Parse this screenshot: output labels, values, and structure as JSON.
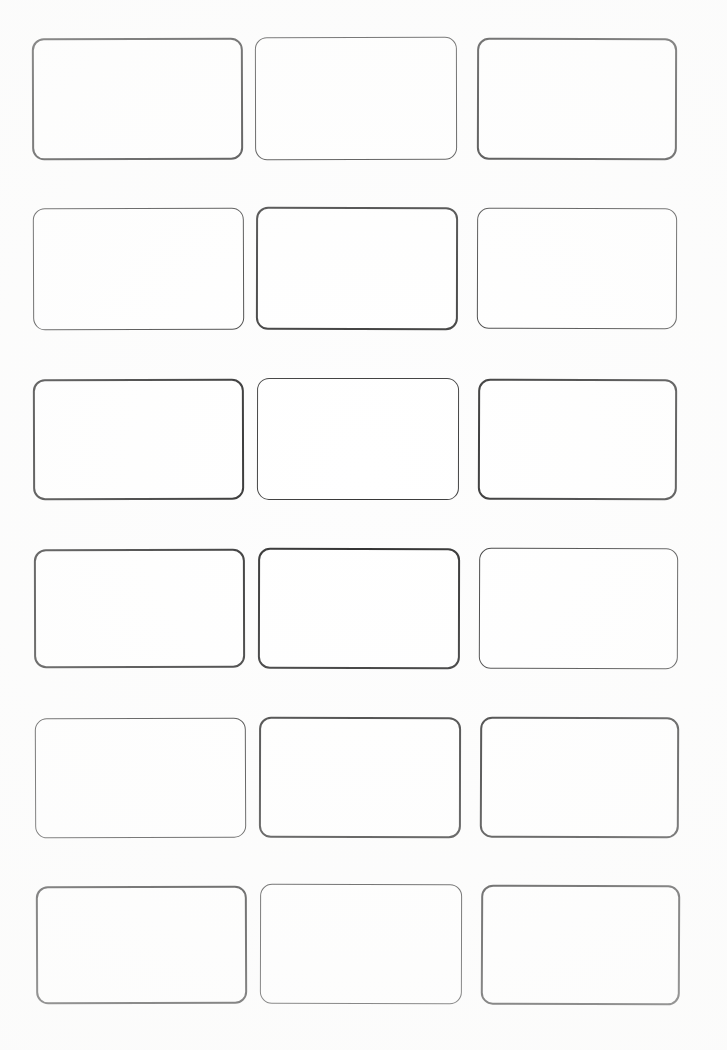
{
  "sheet": {
    "title": "Blank Card Grid Sheet",
    "width": 727,
    "height": 1050,
    "background_color": "#fdfdfd",
    "columns": 3,
    "rows": 6,
    "card_count": 18,
    "stroke_color": "#2b2b2b",
    "stroke_width_px": 2,
    "corner_radius_px": 12,
    "card_fill_color": "#ffffff",
    "content": ""
  },
  "cards": [
    {
      "id": "card-r1c1",
      "row": 1,
      "column": 1,
      "label": "",
      "x": 32,
      "y": 38,
      "width": 211,
      "height": 122,
      "radius": 12,
      "ink": "ink-a",
      "rotate": -0.18
    },
    {
      "id": "card-r1c2",
      "row": 1,
      "column": 2,
      "label": "",
      "x": 255,
      "y": 37,
      "width": 202,
      "height": 123,
      "radius": 12,
      "ink": "ink-b",
      "rotate": -0.12
    },
    {
      "id": "card-r1c3",
      "row": 1,
      "column": 3,
      "label": "",
      "x": 477,
      "y": 38,
      "width": 200,
      "height": 122,
      "radius": 12,
      "ink": "ink-c",
      "rotate": 0.14
    },
    {
      "id": "card-r2c1",
      "row": 2,
      "column": 1,
      "label": "",
      "x": 33,
      "y": 208,
      "width": 211,
      "height": 122,
      "radius": 12,
      "ink": "ink-b",
      "rotate": -0.2
    },
    {
      "id": "card-r2c2",
      "row": 2,
      "column": 2,
      "label": "",
      "x": 256,
      "y": 207,
      "width": 202,
      "height": 123,
      "radius": 12,
      "ink": "ink-a",
      "rotate": 0.1
    },
    {
      "id": "card-r2c3",
      "row": 2,
      "column": 3,
      "label": "",
      "x": 477,
      "y": 208,
      "width": 200,
      "height": 121,
      "radius": 12,
      "ink": "ink-b",
      "rotate": 0.16
    },
    {
      "id": "card-r3c1",
      "row": 3,
      "column": 1,
      "label": "",
      "x": 33,
      "y": 379,
      "width": 211,
      "height": 121,
      "radius": 12,
      "ink": "ink-c",
      "rotate": -0.16
    },
    {
      "id": "card-r3c2",
      "row": 3,
      "column": 2,
      "label": "",
      "x": 257,
      "y": 378,
      "width": 202,
      "height": 122,
      "radius": 12,
      "ink": "ink-b",
      "rotate": 0.08
    },
    {
      "id": "card-r3c3",
      "row": 3,
      "column": 3,
      "label": "",
      "x": 478,
      "y": 379,
      "width": 199,
      "height": 121,
      "radius": 12,
      "ink": "ink-a",
      "rotate": 0.18
    },
    {
      "id": "card-r4c1",
      "row": 4,
      "column": 1,
      "label": "",
      "x": 34,
      "y": 549,
      "width": 211,
      "height": 119,
      "radius": 12,
      "ink": "ink-a",
      "rotate": -0.14
    },
    {
      "id": "card-r4c2",
      "row": 4,
      "column": 2,
      "label": "",
      "x": 258,
      "y": 548,
      "width": 202,
      "height": 121,
      "radius": 12,
      "ink": "ink-c",
      "rotate": 0.12
    },
    {
      "id": "card-r4c3",
      "row": 4,
      "column": 3,
      "label": "",
      "x": 479,
      "y": 548,
      "width": 199,
      "height": 121,
      "radius": 12,
      "ink": "ink-b",
      "rotate": 0.2
    },
    {
      "id": "card-r5c1",
      "row": 5,
      "column": 1,
      "label": "",
      "x": 35,
      "y": 718,
      "width": 211,
      "height": 120,
      "radius": 12,
      "ink": "ink-b",
      "rotate": -0.22
    },
    {
      "id": "card-r5c2",
      "row": 5,
      "column": 2,
      "label": "",
      "x": 259,
      "y": 717,
      "width": 202,
      "height": 121,
      "radius": 12,
      "ink": "ink-a",
      "rotate": 0.1
    },
    {
      "id": "card-r5c3",
      "row": 5,
      "column": 3,
      "label": "",
      "x": 480,
      "y": 717,
      "width": 199,
      "height": 121,
      "radius": 12,
      "ink": "ink-c",
      "rotate": 0.22
    },
    {
      "id": "card-r6c1",
      "row": 6,
      "column": 1,
      "label": "",
      "x": 36,
      "y": 886,
      "width": 211,
      "height": 118,
      "radius": 12,
      "ink": "ink-c",
      "rotate": -0.2
    },
    {
      "id": "card-r6c2",
      "row": 6,
      "column": 2,
      "label": "",
      "x": 260,
      "y": 884,
      "width": 202,
      "height": 120,
      "radius": 12,
      "ink": "ink-b",
      "rotate": 0.14
    },
    {
      "id": "card-r6c3",
      "row": 6,
      "column": 3,
      "label": "",
      "x": 481,
      "y": 885,
      "width": 199,
      "height": 120,
      "radius": 12,
      "ink": "ink-a",
      "rotate": 0.24
    }
  ]
}
